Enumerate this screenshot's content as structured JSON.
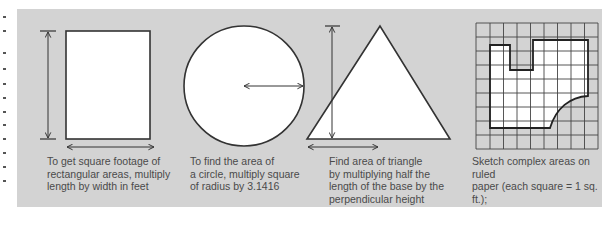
{
  "colors": {
    "panel_bg": "#d3d3d3",
    "shape_fill": "#ffffff",
    "stroke": "#333333",
    "text": "#4a4a4a"
  },
  "panels": [
    {
      "shape": "rectangle",
      "caption": "To get square footage of\nrectangular areas, multiply\nlength by width in feet"
    },
    {
      "shape": "circle",
      "caption": "To find the area of\na circle, multiply square\nof radius by  3.1416"
    },
    {
      "shape": "triangle",
      "caption": "Find area of triangle\nby multiplying half the\nlength of the base by the\nperpendicular height"
    },
    {
      "shape": "ruled-grid-irregular",
      "caption": "Sketch complex areas on ruled\npaper (each square = 1 sq. ft.);\nadd up whole squares and\nthose more than ½ filled"
    }
  ]
}
